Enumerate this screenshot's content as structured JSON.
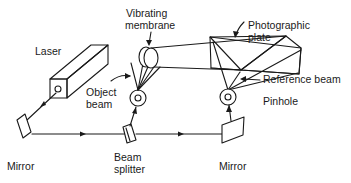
{
  "diagram": {
    "type": "holography-setup",
    "labels": {
      "laser": "Laser",
      "vibrating_membrane_line1": "Vibrating",
      "vibrating_membrane_line2": "membrane",
      "photographic_plate_line1": "Photographic",
      "photographic_plate_line2": "plate",
      "object_beam_line1": "Object",
      "object_beam_line2": "beam",
      "reference_beam": "Reference  beam",
      "pinhole": "Pinhole",
      "mirror_left": "Mirror",
      "beam_splitter_line1": "Beam",
      "beam_splitter_line2": "splitter",
      "mirror_right": "Mirror"
    },
    "components": [
      "laser",
      "mirror-left",
      "beam-splitter",
      "pinhole-object",
      "vibrating-membrane",
      "photographic-plate",
      "pinhole-reference",
      "mirror-right"
    ],
    "colors": {
      "line": "#1a1a1a",
      "background": "#ffffff"
    }
  }
}
